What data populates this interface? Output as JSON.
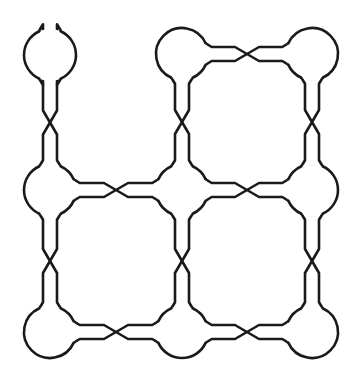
{
  "diagram": {
    "type": "grid-graph",
    "rows": 3,
    "cols": 3,
    "stroke_color": "#1a1a1a",
    "background": "#ffffff",
    "node_radius": 26,
    "tube_half_width": 7,
    "twist_length": 12,
    "nodes": [
      {
        "id": "n00",
        "row": 0,
        "col": 0,
        "x": 50,
        "y": 55
      },
      {
        "id": "n01",
        "row": 0,
        "col": 1,
        "x": 182,
        "y": 54
      },
      {
        "id": "n02",
        "row": 0,
        "col": 2,
        "x": 312,
        "y": 54
      },
      {
        "id": "n10",
        "row": 1,
        "col": 0,
        "x": 50,
        "y": 190
      },
      {
        "id": "n11",
        "row": 1,
        "col": 1,
        "x": 182,
        "y": 190
      },
      {
        "id": "n12",
        "row": 1,
        "col": 2,
        "x": 312,
        "y": 190
      },
      {
        "id": "n20",
        "row": 2,
        "col": 0,
        "x": 50,
        "y": 332
      },
      {
        "id": "n21",
        "row": 2,
        "col": 1,
        "x": 182,
        "y": 332
      },
      {
        "id": "n22",
        "row": 2,
        "col": 2,
        "x": 312,
        "y": 332
      }
    ],
    "edges": [
      {
        "from": "n00",
        "to": "n01",
        "twisted": true
      },
      {
        "from": "n01",
        "to": "n02",
        "twisted": true
      },
      {
        "from": "n10",
        "to": "n11",
        "twisted": true
      },
      {
        "from": "n11",
        "to": "n12",
        "twisted": true
      },
      {
        "from": "n20",
        "to": "n21",
        "twisted": true
      },
      {
        "from": "n21",
        "to": "n22",
        "twisted": true
      },
      {
        "from": "n00",
        "to": "n10",
        "twisted": true
      },
      {
        "from": "n10",
        "to": "n20",
        "twisted": true
      },
      {
        "from": "n01",
        "to": "n11",
        "twisted": true
      },
      {
        "from": "n11",
        "to": "n21",
        "twisted": true
      },
      {
        "from": "n02",
        "to": "n12",
        "twisted": true
      },
      {
        "from": "n12",
        "to": "n22",
        "twisted": true
      }
    ]
  }
}
